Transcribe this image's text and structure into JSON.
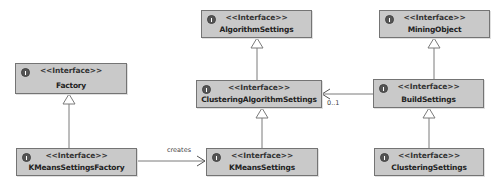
{
  "diagram": {
    "type": "UML class diagram",
    "stereotype": "<<Interface>>",
    "nodes": [
      {
        "id": "factory",
        "name": "Factory",
        "stereotype": "<<Interface>>",
        "icon": "interface-icon"
      },
      {
        "id": "kmeans_settings_factory",
        "name": "KMeansSettingsFactory",
        "stereotype": "<<Interface>>",
        "icon": "interface-icon"
      },
      {
        "id": "algorithm_settings",
        "name": "AlgorithmSettings",
        "stereotype": "<<Interface>>",
        "icon": "interface-icon"
      },
      {
        "id": "clustering_algorithm_settings",
        "name": "ClusteringAlgorithmSettings",
        "stereotype": "<<Interface>>",
        "icon": "interface-icon"
      },
      {
        "id": "kmeans_settings",
        "name": "KMeansSettings",
        "stereotype": "<<Interface>>",
        "icon": "interface-icon"
      },
      {
        "id": "mining_object",
        "name": "MiningObject",
        "stereotype": "<<Interface>>",
        "icon": "interface-icon"
      },
      {
        "id": "build_settings",
        "name": "BuildSettings",
        "stereotype": "<<Interface>>",
        "icon": "interface-icon"
      },
      {
        "id": "clustering_settings",
        "name": "ClusteringSettings",
        "stereotype": "<<Interface>>",
        "icon": "interface-icon"
      }
    ],
    "edges": [
      {
        "from": "kmeans_settings_factory",
        "to": "factory",
        "kind": "generalization",
        "label": ""
      },
      {
        "from": "clustering_algorithm_settings",
        "to": "algorithm_settings",
        "kind": "generalization",
        "label": ""
      },
      {
        "from": "kmeans_settings",
        "to": "clustering_algorithm_settings",
        "kind": "generalization",
        "label": ""
      },
      {
        "from": "build_settings",
        "to": "mining_object",
        "kind": "generalization",
        "label": ""
      },
      {
        "from": "clustering_settings",
        "to": "build_settings",
        "kind": "generalization",
        "label": ""
      },
      {
        "from": "kmeans_settings_factory",
        "to": "kmeans_settings",
        "kind": "dependency",
        "label": "creates"
      },
      {
        "from": "build_settings",
        "to": "clustering_algorithm_settings",
        "kind": "association",
        "label": "0..1"
      }
    ],
    "labels": {
      "creates": "creates",
      "multiplicity": "0..1"
    },
    "colors": {
      "box_fill": "#c9c9c9",
      "box_border": "#747474",
      "line": "#7a7a7a",
      "text": "#222222"
    }
  }
}
